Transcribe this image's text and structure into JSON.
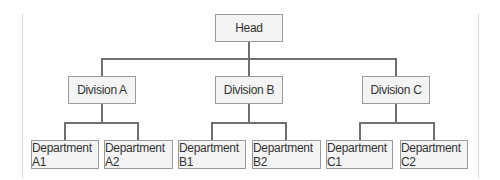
{
  "chart": {
    "title": "",
    "root": {
      "label": "Head"
    },
    "divisions": [
      {
        "label": "Division A",
        "departments": [
          {
            "label": "Department A1"
          },
          {
            "label": "Department A2"
          }
        ]
      },
      {
        "label": "Division B",
        "departments": [
          {
            "label": "Department B1"
          },
          {
            "label": "Department B2"
          }
        ]
      },
      {
        "label": "Division C",
        "departments": [
          {
            "label": "Department C1"
          },
          {
            "label": "Department C2"
          }
        ]
      }
    ]
  },
  "colors": {
    "box_fill": "#f4f4f4",
    "box_border": "#9a9a9a",
    "connector": "#6f6f6f",
    "text": "#333333"
  }
}
